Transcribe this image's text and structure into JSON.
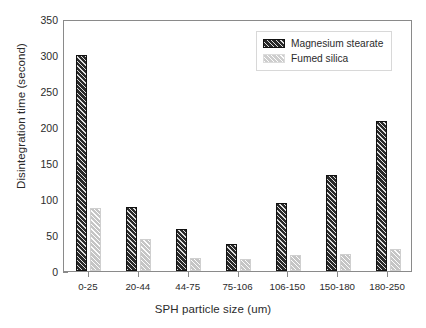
{
  "chart_data": {
    "type": "bar",
    "title": "",
    "xlabel": "SPH particle size (um)",
    "ylabel": "Disintegration time (second)",
    "categories": [
      "0-25",
      "20-44",
      "44-75",
      "75-106",
      "106-150",
      "150-180",
      "180-250"
    ],
    "series": [
      {
        "name": "Magnesium stearate",
        "pattern": "dark-hatched",
        "color": "#2a2a2a",
        "values": [
          300,
          89,
          58,
          38,
          94,
          133,
          208
        ]
      },
      {
        "name": "Fumed silica",
        "pattern": "light-hatched",
        "color": "#e6e6e6",
        "values": [
          88,
          44,
          18,
          17,
          22,
          24,
          30
        ]
      }
    ],
    "ylim": [
      0,
      350
    ],
    "yticks": [
      0,
      50,
      100,
      150,
      200,
      250,
      300,
      350
    ],
    "ytick_labels": [
      "0",
      "50",
      "100",
      "150",
      "200",
      "250",
      "300",
      "350"
    ],
    "grid": false,
    "legend_position": "top-right"
  }
}
